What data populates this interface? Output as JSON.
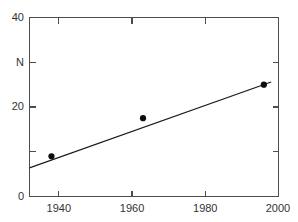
{
  "chart_data": {
    "type": "scatter",
    "title": "",
    "subtitle": "",
    "xlabel": "",
    "ylabel": "N",
    "xlim": [
      1932,
      2000
    ],
    "ylim": [
      0,
      40
    ],
    "grid": false,
    "legend": null,
    "x_ticks": [
      1940,
      1960,
      1980,
      2000
    ],
    "x_tick_labels": [
      "1940",
      "1960",
      "1980",
      "2000"
    ],
    "y_ticks": [
      0,
      10,
      20,
      30,
      40
    ],
    "y_tick_labels": [
      "0",
      "",
      "20",
      "",
      "40"
    ],
    "y_labeled_ticks": [
      {
        "value": 40,
        "label": "40"
      },
      {
        "value": 20,
        "label": "20"
      },
      {
        "value": 0,
        "label": "0"
      }
    ],
    "y_axis_title_at": 30,
    "points": [
      {
        "x": 1938,
        "y": 9.0
      },
      {
        "x": 1963,
        "y": 17.5
      },
      {
        "x": 1996,
        "y": 25.0
      }
    ],
    "series": [
      {
        "name": "data",
        "type": "scatter",
        "x": [
          1938,
          1963,
          1996
        ],
        "y": [
          9.0,
          17.5,
          25.0
        ]
      },
      {
        "name": "linear fit",
        "type": "line",
        "x": [
          1932,
          1998
        ],
        "y": [
          6.4,
          25.6
        ]
      }
    ],
    "fit_line": {
      "x_start": 1932,
      "y_start": 6.4,
      "x_end": 1998,
      "y_end": 25.6
    },
    "colors": {
      "marker": "#0d0d0d",
      "line": "#1a1a1a",
      "axis": "#4d4d4d",
      "text": "#333333",
      "background": "#ffffff"
    }
  },
  "figure": {
    "alt": "Scatter plot of N versus year with linear trend line"
  }
}
